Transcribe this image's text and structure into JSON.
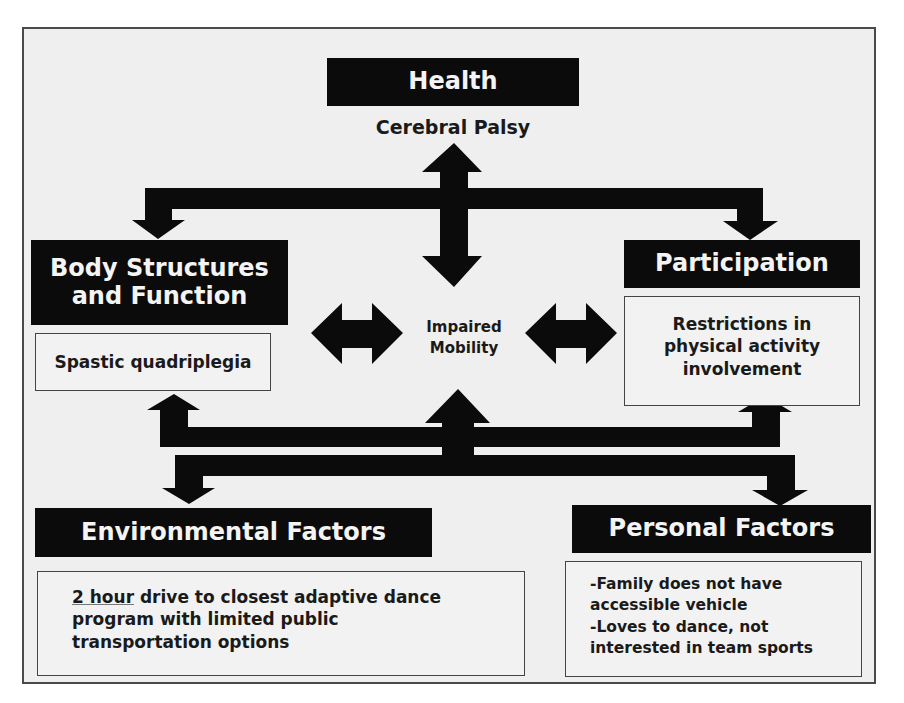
{
  "diagram": {
    "health": {
      "header": "Health",
      "detail": "Cerebral Palsy"
    },
    "body_structures": {
      "header_line1": "Body Structures",
      "header_line2": "and Function",
      "detail": "Spastic quadriplegia"
    },
    "center": {
      "line1": "Impaired",
      "line2": "Mobility"
    },
    "participation": {
      "header": "Participation",
      "detail_line1": "Restrictions in",
      "detail_line2": "physical activity",
      "detail_line3": "involvement"
    },
    "environmental": {
      "header": "Environmental Factors",
      "detail_underlined": "2 hour",
      "detail_rest_line1": " drive to closest adaptive dance",
      "detail_line2": "program with limited public",
      "detail_line3": "transportation options"
    },
    "personal": {
      "header": "Personal Factors",
      "detail_line1": "-Family does not have",
      "detail_line2": "accessible vehicle",
      "detail_line3": "-Loves to dance, not",
      "detail_line4": "interested in team sports"
    },
    "colors": {
      "header_bg": "#0b0b0b",
      "header_text": "#f4f4f4",
      "panel_bg": "#efefef",
      "arrow": "#0b0b0b"
    }
  }
}
